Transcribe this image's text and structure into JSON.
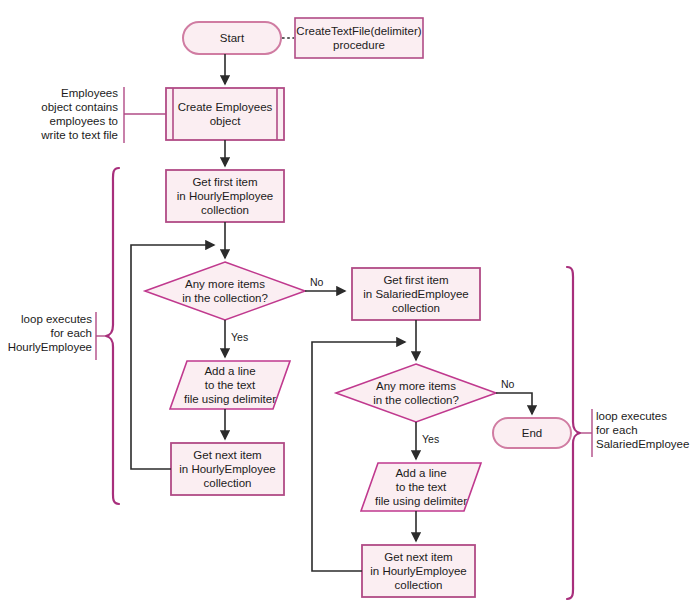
{
  "diagram": {
    "colors": {
      "shape_fill": "#fbeef2",
      "shape_stroke": "#b14b86",
      "shape_stroke_alt": "#c0398e",
      "terminator_stroke": "#d07ca2",
      "connector_stroke": "#2b2b2b",
      "brace_stroke": "#a82f7c",
      "annotation_rule": "#b14b86",
      "text": "#1b1b1b"
    },
    "nodes": [
      {
        "id": "start",
        "shape": "terminator",
        "label": "Start"
      },
      {
        "id": "proc_note",
        "shape": "note",
        "label": "CreateTextFile(delimiter)\nprocedure"
      },
      {
        "id": "create_emp",
        "shape": "predefined-process",
        "label": "Create Employees\nobject"
      },
      {
        "id": "get_first_h",
        "shape": "process",
        "label": "Get first item\nin HourlyEmployee\ncollection"
      },
      {
        "id": "decide_h",
        "shape": "decision",
        "label": "Any more items\nin the collection?"
      },
      {
        "id": "add_line_h",
        "shape": "io",
        "label": "Add a line\nto the text\nfile using delimiter"
      },
      {
        "id": "get_next_h",
        "shape": "process",
        "label": "Get next item\nin HourlyEmployee\ncollection"
      },
      {
        "id": "get_first_s",
        "shape": "process",
        "label": "Get first item\nin SalariedEmployee\ncollection"
      },
      {
        "id": "decide_s",
        "shape": "decision",
        "label": "Any more items\nin the collection?"
      },
      {
        "id": "add_line_s",
        "shape": "io",
        "label": "Add a line\nto the text\nfile using delimiter"
      },
      {
        "id": "get_next_s",
        "shape": "process",
        "label": "Get next item\nin HourlyEmployee\ncollection"
      },
      {
        "id": "end",
        "shape": "terminator",
        "label": "End"
      }
    ],
    "edge_labels": {
      "decide_h_no": "No",
      "decide_h_yes": "Yes",
      "decide_s_no": "No",
      "decide_s_yes": "Yes"
    },
    "annotations": [
      {
        "id": "employees-note",
        "text": "Employees\nobject contains\nemployees to\nwrite to text file",
        "align": "right"
      },
      {
        "id": "hourly-loop-note",
        "text": "loop executes\nfor each\nHourlyEmployee",
        "align": "right"
      },
      {
        "id": "salaried-loop-note",
        "text": "loop executes\nfor each\nSalariedEmployee",
        "align": "left"
      }
    ]
  }
}
